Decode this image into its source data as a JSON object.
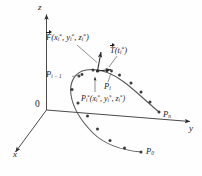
{
  "figure": {
    "background_color": "#fefefe",
    "stroke_color": "#4a4a4a",
    "text_color": "#1c1c1c"
  },
  "axes": {
    "z_label": "z",
    "y_label": "y",
    "x_label": "x",
    "origin_label": "0"
  },
  "curve": {
    "start_label": "P",
    "start_sub": "0",
    "end_label": "P",
    "end_sub": "n",
    "prev_point_label": "P",
    "prev_point_sub": "i − 1",
    "point_label": "P",
    "point_sub": "i",
    "sample_label": "P",
    "sample_sub": "i",
    "sample_sup": "*",
    "sample_coords": "(x",
    "sample_coords_full": "(x*i, y*i, z*i)"
  },
  "vectors": {
    "field_symbol": "F",
    "field_args": "(x",
    "field_full": "F(x*i, y*i, z*i)",
    "tangent_symbol": "T",
    "tangent_args": "(t*i)",
    "tangent_full": "T(t*i)"
  },
  "coords": {
    "x_star": "x",
    "y_star": "y",
    "z_star": "z",
    "t_star": "t",
    "star": "*",
    "i": "i",
    "comma": ", ",
    "lparen": "(",
    "rparen": ")"
  }
}
